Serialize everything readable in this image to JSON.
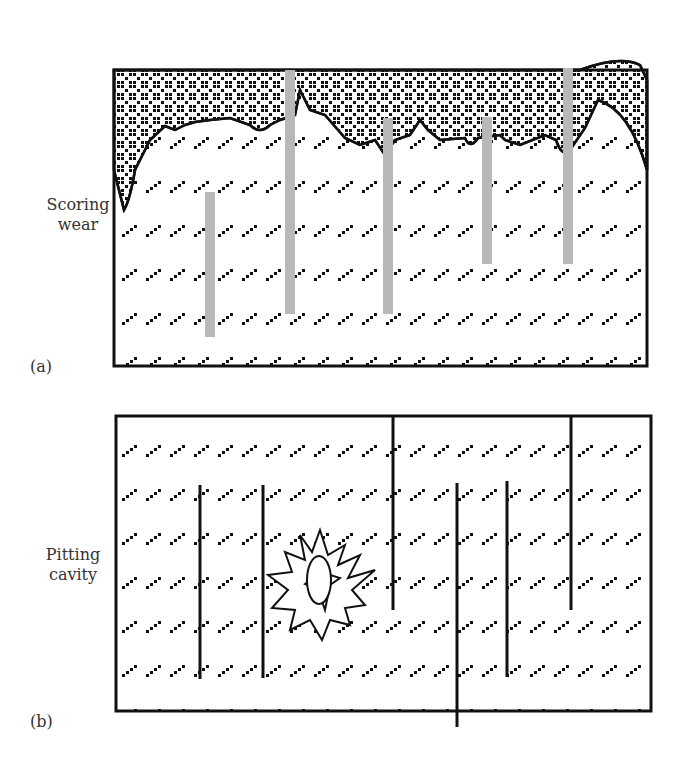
{
  "figure": {
    "panels": [
      {
        "id": "a",
        "tag": "(a)",
        "label_line1": "Scoring",
        "label_line2": "wear",
        "gray_bars": 5,
        "bar_color": "#b8b8b8"
      },
      {
        "id": "b",
        "tag": "(b)",
        "label_line1": "Pitting",
        "label_line2": "cavity",
        "crack_lines": 7
      }
    ]
  }
}
